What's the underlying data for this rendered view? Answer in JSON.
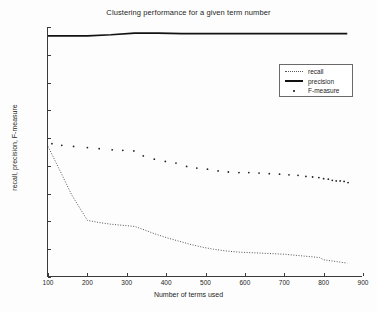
{
  "chart_data": {
    "type": "line",
    "title": "Clustering performance for a given term number",
    "xlabel": "Number of terms used",
    "ylabel": "recall, precision, F-measure",
    "xlim": [
      100,
      900
    ],
    "ylim": [
      0.55,
      1
    ],
    "xticks": [
      100,
      200,
      300,
      400,
      500,
      600,
      700,
      800,
      900
    ],
    "yticks": [
      0.55,
      0.6,
      0.65,
      0.7,
      0.75,
      0.8,
      0.85,
      0.9,
      0.95,
      1
    ],
    "grid": false,
    "legend_position": "upper right",
    "series": [
      {
        "name": "recall",
        "style": "dotted",
        "color": "#555555",
        "x": [
          100,
          130,
          160,
          200,
          230,
          260,
          290,
          320,
          340,
          370,
          400,
          430,
          460,
          490,
          520,
          550,
          580,
          610,
          640,
          670,
          700,
          730,
          760,
          790,
          800,
          820,
          840,
          860
        ],
        "y": [
          0.785,
          0.742,
          0.698,
          0.652,
          0.648,
          0.645,
          0.643,
          0.641,
          0.636,
          0.628,
          0.621,
          0.615,
          0.609,
          0.604,
          0.6,
          0.597,
          0.595,
          0.594,
          0.593,
          0.592,
          0.591,
          0.589,
          0.587,
          0.585,
          0.581,
          0.579,
          0.577,
          0.575
        ]
      },
      {
        "name": "precision",
        "style": "solid",
        "color": "#121212",
        "x": [
          100,
          200,
          260,
          320,
          380,
          440,
          500,
          560,
          620,
          680,
          740,
          800,
          860
        ],
        "y": [
          0.984,
          0.984,
          0.986,
          0.989,
          0.989,
          0.988,
          0.988,
          0.988,
          0.988,
          0.988,
          0.988,
          0.988,
          0.988
        ]
      },
      {
        "name": "F-measure",
        "style": "dots",
        "color": "#222222",
        "x": [
          110,
          135,
          165,
          200,
          230,
          263,
          290,
          318,
          342,
          370,
          398,
          425,
          452,
          478,
          505,
          532,
          558,
          585,
          610,
          636,
          662,
          688,
          712,
          735,
          755,
          772,
          788,
          800,
          812,
          822,
          832,
          842,
          852,
          862
        ],
        "y": [
          0.79,
          0.787,
          0.785,
          0.783,
          0.781,
          0.779,
          0.778,
          0.777,
          0.768,
          0.762,
          0.758,
          0.755,
          0.749,
          0.746,
          0.744,
          0.741,
          0.739,
          0.738,
          0.738,
          0.737,
          0.736,
          0.735,
          0.734,
          0.733,
          0.731,
          0.73,
          0.729,
          0.727,
          0.726,
          0.724,
          0.723,
          0.723,
          0.722,
          0.72
        ]
      }
    ]
  },
  "legend": {
    "items": [
      {
        "label": "recall",
        "key": "dotted-line-key"
      },
      {
        "label": "precision",
        "key": "solid-line-key"
      },
      {
        "label": "F-measure",
        "key": "dot-marker-key"
      }
    ]
  }
}
